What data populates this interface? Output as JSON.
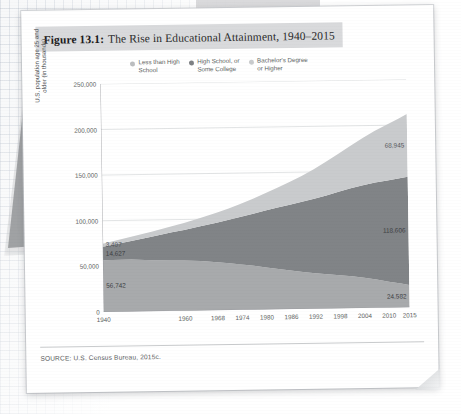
{
  "figure": {
    "number_label": "Figure 13.1:",
    "title": "The Rise in Educational Attainment, 1940–2015",
    "source": "SOURCE: U.S. Census Bureau, 2015c."
  },
  "chart_data": {
    "type": "area",
    "title": "The Rise in Educational Attainment, 1940–2015",
    "xlabel": "",
    "ylabel": "U.S. population age 25 and\nolder (in thousands)",
    "grid": true,
    "legend_position": "top-center",
    "stacked": true,
    "xlim": [
      1940,
      2015
    ],
    "ylim": [
      0,
      250000
    ],
    "yticks": [
      0,
      50000,
      100000,
      150000,
      200000,
      250000
    ],
    "ytick_labels": [
      "0",
      "50,000",
      "100,000",
      "150,000",
      "200,000",
      "250,000"
    ],
    "xticks": [
      1940,
      1960,
      1968,
      1974,
      1980,
      1986,
      1992,
      1998,
      2004,
      2010,
      2015
    ],
    "xtick_labels": [
      "1940",
      "1960",
      "1968",
      "1974",
      "1980",
      "1986",
      "1992",
      "1998",
      "2004",
      "2010",
      "2015"
    ],
    "x": [
      1940,
      1947,
      1952,
      1957,
      1960,
      1964,
      1968,
      1971,
      1974,
      1977,
      1980,
      1983,
      1986,
      1989,
      1992,
      1995,
      1998,
      2001,
      2004,
      2007,
      2010,
      2013,
      2015
    ],
    "series": [
      {
        "name": "Less than High School",
        "color": "#a8aaac",
        "stack_order": 1,
        "values": [
          56742,
          56900,
          55800,
          55200,
          55000,
          54200,
          52500,
          51200,
          49800,
          48100,
          46000,
          44200,
          42400,
          40600,
          39000,
          37600,
          36400,
          34900,
          33100,
          31000,
          28500,
          26200,
          24582
        ]
      },
      {
        "name": "High School, or Some College",
        "color": "#818487",
        "stack_order": 2,
        "values": [
          14627,
          20500,
          25800,
          30900,
          33500,
          38200,
          43500,
          47800,
          52400,
          57200,
          62500,
          67400,
          72000,
          76800,
          81500,
          86500,
          91500,
          96500,
          101500,
          106500,
          111000,
          115500,
          118606
        ]
      },
      {
        "name": "Bachelor's Degree or Higher",
        "color": "#c9cbcd",
        "stack_order": 3,
        "values": [
          3407,
          4600,
          5600,
          6700,
          7600,
          9000,
          10800,
          12400,
          14200,
          16400,
          19000,
          21800,
          25000,
          28500,
          32500,
          37000,
          41500,
          46500,
          51500,
          56500,
          61000,
          65500,
          68945
        ]
      }
    ],
    "annotations": [
      {
        "text": "3,407",
        "series": "Bachelor's Degree or Higher",
        "at_x": 1940,
        "side": "left"
      },
      {
        "text": "14,627",
        "series": "High School, or Some College",
        "at_x": 1940,
        "side": "left"
      },
      {
        "text": "56,742",
        "series": "Less than High School",
        "at_x": 1940,
        "side": "left"
      },
      {
        "text": "68,945",
        "series": "Bachelor's Degree or Higher",
        "at_x": 2015,
        "side": "right"
      },
      {
        "text": "118,606",
        "series": "High School, or Some College",
        "at_x": 2015,
        "side": "right"
      },
      {
        "text": "24,582",
        "series": "Less than High School",
        "at_x": 2015,
        "side": "right"
      }
    ]
  },
  "legend": {
    "items": [
      {
        "label": "Less than High\nSchool",
        "color": "#bcbec0"
      },
      {
        "label": "High School, or\nSome College",
        "color": "#7e8184"
      },
      {
        "label": "Bachelor's Degree\nor Higher",
        "color": "#c9cbcd"
      }
    ]
  }
}
